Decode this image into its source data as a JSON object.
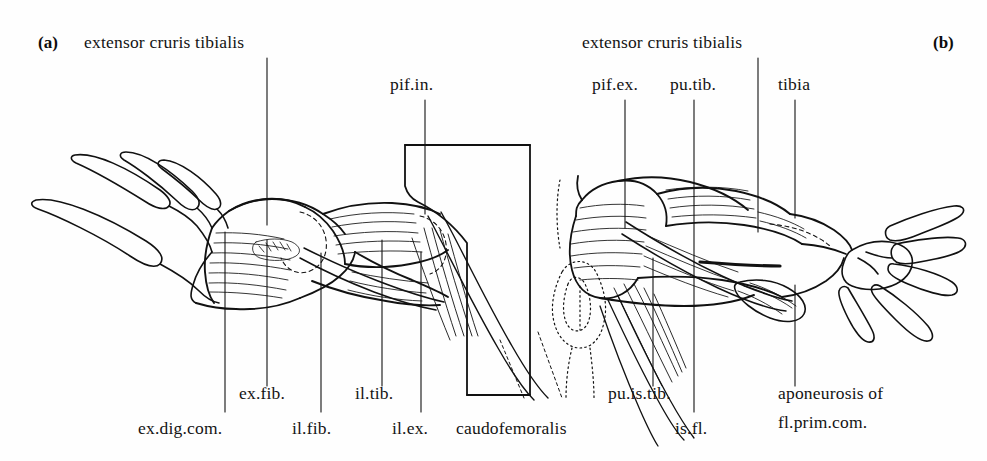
{
  "figure": {
    "panels": [
      {
        "tag": "(a)",
        "name": "panel-a"
      },
      {
        "tag": "(b)",
        "name": "panel-b"
      }
    ],
    "ink_color": "#111111",
    "background_color": "#fefefe"
  },
  "labels_panel_a": {
    "extensor_cruris_tibialis": "extensor cruris tibialis",
    "pif_in": "pif.in.",
    "ex_fib": "ex.fib.",
    "il_tib": "il.tib.",
    "ex_dig_com": "ex.dig.com.",
    "il_fib": "il.fib.",
    "il_ex": "il.ex.",
    "caudofemoralis": "caudofemoralis"
  },
  "labels_panel_b": {
    "extensor_cruris_tibialis": "extensor cruris tibialis",
    "pif_ex": "pif.ex.",
    "pu_tib": "pu.tib.",
    "tibia": "tibia",
    "pu_is_tib": "pu.is.tib.",
    "is_fl": "is.fl.",
    "aponeurosis_line1": "aponeurosis of",
    "aponeurosis_line2": "fl.prim.com."
  }
}
